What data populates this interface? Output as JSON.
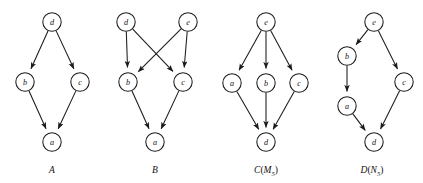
{
  "figure": {
    "background_color": "#ffffff",
    "ink_color": "#1a1a1a",
    "node_radius": 9.2,
    "panels": [
      {
        "id": "A",
        "caption": "A",
        "caption_main": "A",
        "caption_sub": "",
        "caption_x": 52,
        "caption_y": 170,
        "nodes": [
          {
            "id": "d",
            "label": "d",
            "x": 52,
            "y": 22
          },
          {
            "id": "b",
            "label": "b",
            "x": 25,
            "y": 82
          },
          {
            "id": "c",
            "label": "c",
            "x": 80,
            "y": 82
          },
          {
            "id": "a",
            "label": "a",
            "x": 52,
            "y": 142
          }
        ],
        "edges": [
          {
            "from": "d",
            "to": "b"
          },
          {
            "from": "d",
            "to": "c"
          },
          {
            "from": "b",
            "to": "a"
          },
          {
            "from": "c",
            "to": "a"
          }
        ]
      },
      {
        "id": "B",
        "caption": "B",
        "caption_main": "B",
        "caption_sub": "",
        "caption_x": 155,
        "caption_y": 170,
        "nodes": [
          {
            "id": "d",
            "label": "d",
            "x": 126,
            "y": 22
          },
          {
            "id": "e",
            "label": "e",
            "x": 188,
            "y": 22
          },
          {
            "id": "b",
            "label": "b",
            "x": 128,
            "y": 82
          },
          {
            "id": "c",
            "label": "c",
            "x": 183,
            "y": 82
          },
          {
            "id": "a",
            "label": "a",
            "x": 155,
            "y": 142
          }
        ],
        "edges": [
          {
            "from": "d",
            "to": "b"
          },
          {
            "from": "d",
            "to": "c"
          },
          {
            "from": "e",
            "to": "b"
          },
          {
            "from": "e",
            "to": "c"
          },
          {
            "from": "b",
            "to": "a"
          },
          {
            "from": "c",
            "to": "a"
          }
        ]
      },
      {
        "id": "C",
        "caption": "C(M5)",
        "caption_main": "C",
        "caption_sub": "5",
        "caption_inner": "M",
        "caption_x": 266,
        "caption_y": 170,
        "nodes": [
          {
            "id": "e",
            "label": "e",
            "x": 266,
            "y": 22
          },
          {
            "id": "a",
            "label": "a",
            "x": 232,
            "y": 83
          },
          {
            "id": "b",
            "label": "b",
            "x": 266,
            "y": 83
          },
          {
            "id": "c",
            "label": "c",
            "x": 299,
            "y": 83
          },
          {
            "id": "d",
            "label": "d",
            "x": 266,
            "y": 142
          }
        ],
        "edges": [
          {
            "from": "e",
            "to": "a"
          },
          {
            "from": "e",
            "to": "b"
          },
          {
            "from": "e",
            "to": "c"
          },
          {
            "from": "a",
            "to": "d"
          },
          {
            "from": "b",
            "to": "d"
          },
          {
            "from": "c",
            "to": "d"
          }
        ]
      },
      {
        "id": "D",
        "caption": "D(N5)",
        "caption_main": "D",
        "caption_sub": "5",
        "caption_inner": "N",
        "caption_x": 372,
        "caption_y": 170,
        "nodes": [
          {
            "id": "e",
            "label": "e",
            "x": 374,
            "y": 22
          },
          {
            "id": "b",
            "label": "b",
            "x": 347,
            "y": 56
          },
          {
            "id": "c",
            "label": "c",
            "x": 404,
            "y": 82
          },
          {
            "id": "a",
            "label": "a",
            "x": 347,
            "y": 106
          },
          {
            "id": "d",
            "label": "d",
            "x": 374,
            "y": 142
          }
        ],
        "edges": [
          {
            "from": "e",
            "to": "b"
          },
          {
            "from": "e",
            "to": "c"
          },
          {
            "from": "b",
            "to": "a"
          },
          {
            "from": "a",
            "to": "d"
          },
          {
            "from": "c",
            "to": "d"
          }
        ]
      }
    ]
  }
}
